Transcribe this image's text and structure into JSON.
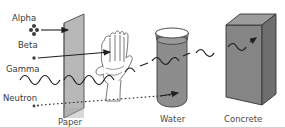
{
  "diagram": {
    "background": "#ffffff",
    "border_color": "#cfcfcf"
  },
  "radiation_labels": [
    {
      "id": "alpha",
      "text": "Alpha",
      "x": 12,
      "y": 21,
      "symbol": "four-dot-cluster",
      "track": "solid-arrow"
    },
    {
      "id": "beta",
      "text": "Beta",
      "x": 18,
      "y": 48,
      "symbol": "single-dot",
      "track": "solid-arrow"
    },
    {
      "id": "gamma",
      "text": "Gamma",
      "x": 6,
      "y": 72,
      "symbol": "wave",
      "track": "wavy-line"
    },
    {
      "id": "neutron",
      "text": "Neutron",
      "x": 3,
      "y": 101,
      "symbol": "dots",
      "track": "dotted-line"
    }
  ],
  "barrier_labels": [
    {
      "id": "paper",
      "text": "Paper",
      "x": 58,
      "y": 124
    },
    {
      "id": "water",
      "text": "Water",
      "x": 163,
      "y": 121
    },
    {
      "id": "concrete",
      "text": "Concrete",
      "x": 227,
      "y": 121
    }
  ],
  "barriers": [
    {
      "id": "paper-sheet",
      "name": "Paper",
      "fill": "#b5b5b5",
      "stroke": "#4a4a4a"
    },
    {
      "id": "hand",
      "name": "Hand",
      "fill": "#ffffff",
      "stroke": "#555555"
    },
    {
      "id": "water-beaker",
      "name": "Water",
      "fill": "#8d8d8d",
      "stroke": "#3c3c3c"
    },
    {
      "id": "concrete-block",
      "name": "Concrete",
      "fill": "#858585",
      "stroke": "#333333"
    }
  ],
  "colors": {
    "ink": "#3a3a3a",
    "line": "#2b2b2b",
    "paper_gray": "#b5b5b5",
    "water_gray": "#8d8d8d",
    "concrete_gray": "#858585",
    "concrete_top": "#9c9c9c",
    "concrete_side": "#6f6f6f",
    "border": "#cfcfcf"
  }
}
